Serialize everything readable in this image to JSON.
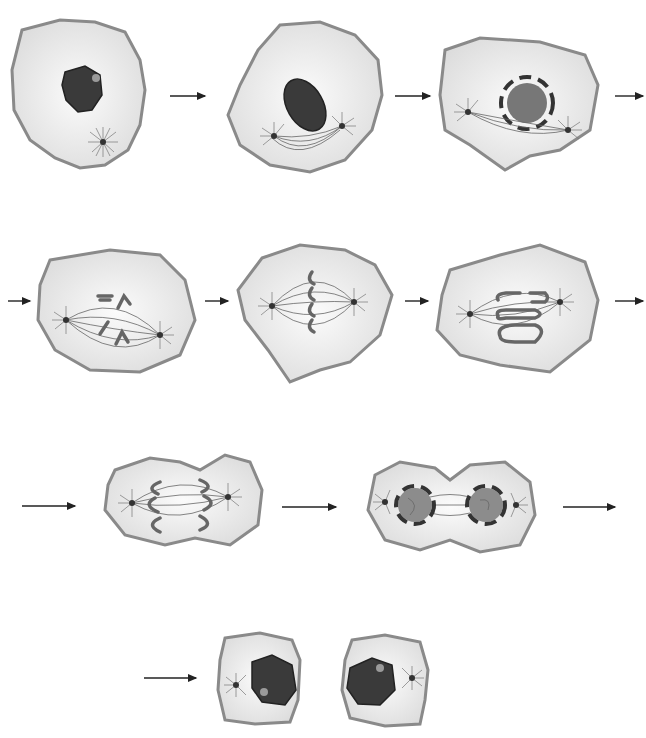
{
  "diagram": {
    "title": "",
    "colors": {
      "background": "#ffffff",
      "cytoplasm": "#e4e4e4",
      "cell_membrane": "#8a8a8a",
      "nucleus": "#3a3a3a",
      "arrow": "#222222"
    },
    "rows": [
      {
        "stages": [
          "interphase-cell",
          "early-prophase-cell",
          "prometaphase-cell"
        ]
      },
      {
        "stages": [
          "late-prometaphase-cell",
          "metaphase-cell",
          "anaphase-cell"
        ]
      },
      {
        "stages": [
          "late-anaphase-cell",
          "telophase-cell"
        ]
      },
      {
        "stages": [
          "daughter-cells"
        ]
      }
    ],
    "arrow_count": 9,
    "labels": []
  }
}
